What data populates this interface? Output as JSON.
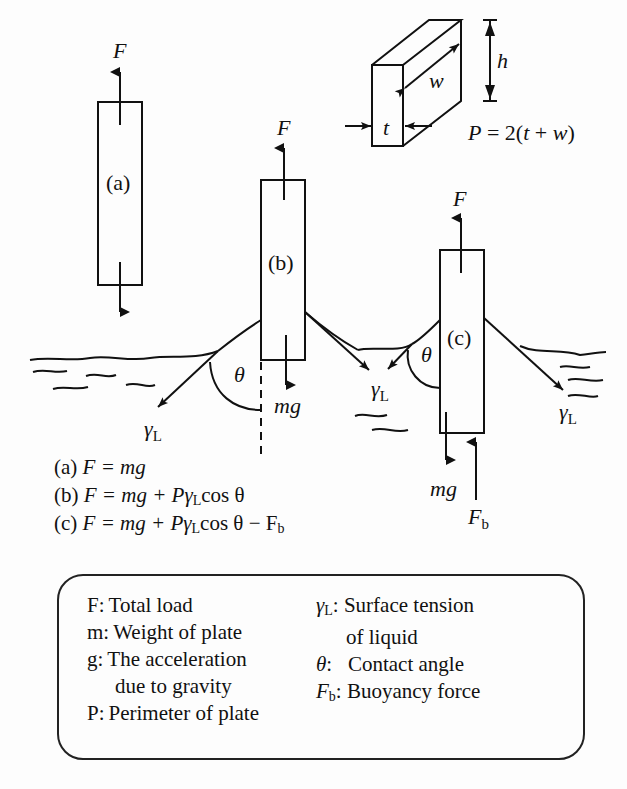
{
  "figure": {
    "dimension_inset": {
      "labels": {
        "height": "h",
        "width": "w",
        "thickness": "t"
      },
      "perimeter_formula": "P = 2(t + w)"
    },
    "plates": [
      {
        "id": "a",
        "label": "(a)",
        "force_up": "F",
        "state": "in air"
      },
      {
        "id": "b",
        "label": "(b)",
        "force_up": "F",
        "weight": "mg",
        "contact_angle": "θ",
        "surface_tension": "γL",
        "state": "touching liquid surface"
      },
      {
        "id": "c",
        "label": "(c)",
        "force_up": "F",
        "weight": "mg",
        "buoyancy": "Fb",
        "contact_angle": "θ",
        "surface_tension": "γL",
        "state": "partially immersed"
      }
    ],
    "symbols": {
      "F": "F",
      "mg": "mg",
      "theta": "θ",
      "gamma": "γ",
      "gamma_sub": "L",
      "Fb": "F",
      "Fb_sub": "b"
    }
  },
  "equations": [
    {
      "case": "(a)",
      "lhs": "F",
      "rhs": "= mg"
    },
    {
      "case": "(b)",
      "lhs": "F",
      "rhs": "= mg + Pγ",
      "sub": "L",
      "tail": "cos θ"
    },
    {
      "case": "(c)",
      "lhs": "F",
      "rhs": "= mg + Pγ",
      "sub": "L",
      "tail": "cos θ − F",
      "sub2": "b"
    }
  ],
  "legend": {
    "left": [
      {
        "key": "F:",
        "text": "Total load"
      },
      {
        "key": "m:",
        "text": "Weight of plate"
      },
      {
        "key": "g:",
        "text": "The acceleration"
      },
      {
        "key": "",
        "text": "due to gravity"
      },
      {
        "key": "P:",
        "text": "Perimeter of plate"
      }
    ],
    "right": [
      {
        "key": "γ",
        "key_sub": "L",
        "text": ": Surface tension"
      },
      {
        "key": "",
        "key_sub": "",
        "text": "of liquid"
      },
      {
        "key": "θ",
        "key_sub": "",
        "text": ":   Contact angle"
      },
      {
        "key": "F",
        "key_sub": "b",
        "text": ": Buoyancy force"
      }
    ]
  }
}
